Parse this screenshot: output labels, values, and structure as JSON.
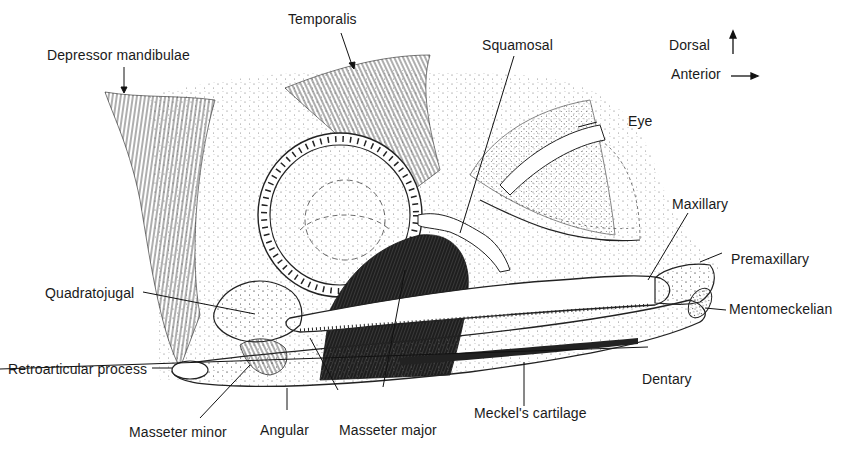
{
  "figure": {
    "orientation": {
      "dorsal_label": "Dorsal",
      "anterior_label": "Anterior"
    },
    "labels": {
      "depressor_mandibulae": "Depressor mandibulae",
      "temporalis": "Temporalis",
      "squamosal": "Squamosal",
      "eye": "Eye",
      "maxillary": "Maxillary",
      "premaxillary": "Premaxillary",
      "mentomeckelian": "Mentomeckelian",
      "dentary": "Dentary",
      "meckels_cartilage": "Meckel's cartilage",
      "masseter_major": "Masseter major",
      "angular": "Angular",
      "masseter_minor": "Masseter minor",
      "retroarticular_process": "Retroarticular process",
      "quadratojugal": "Quadratojugal"
    }
  }
}
